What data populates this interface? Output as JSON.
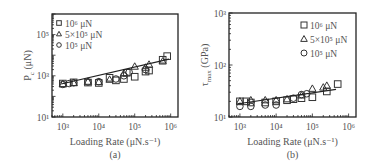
{
  "chart_data": [
    {
      "type": "scatter",
      "panel_label": "(a)",
      "title": "",
      "xlabel": "Loading Rate (μN.s⁻¹)",
      "ylabel": "P_c (μN)",
      "ylabel_main": "P",
      "ylabel_sub": "c",
      "ylabel_unit": " (μN)",
      "xscale": "log",
      "yscale": "log",
      "xlim": [
        500,
        1600000
      ],
      "ylim": [
        10,
        1000000
      ],
      "xticks": [
        1000,
        10000,
        100000,
        1000000
      ],
      "xtick_labels": [
        "10³",
        "10⁴",
        "10⁵",
        "10⁶"
      ],
      "yticks": [
        10,
        1000,
        100000
      ],
      "ytick_labels": [
        "10¹",
        "10³",
        "10⁵"
      ],
      "grid": false,
      "legend_position": "upper left",
      "legend": [
        "10⁶ μN",
        "5×10⁵ μN",
        "10⁵ μN"
      ],
      "series": [
        {
          "name": "10⁶ μN",
          "marker": "square",
          "x": [
            1000,
            2000,
            5000,
            10000,
            20000,
            30000,
            50000,
            60000,
            100000,
            200000,
            250000,
            600000,
            800000
          ],
          "y": [
            420,
            480,
            470,
            450,
            800,
            600,
            700,
            1400,
            900,
            1600,
            1800,
            6000,
            9000
          ]
        },
        {
          "name": "5×10⁵ μN",
          "marker": "triangle",
          "x": [
            1000,
            2000,
            5000,
            10000,
            20000,
            50000,
            100000,
            200000,
            250000,
            600000
          ],
          "y": [
            400,
            450,
            520,
            500,
            650,
            1300,
            2800,
            2500,
            3500,
            5000
          ]
        },
        {
          "name": "10⁵ μN",
          "marker": "circle",
          "x": [
            1000,
            1500,
            2000,
            5000,
            10000,
            30000,
            50000,
            70000,
            200000
          ],
          "y": [
            380,
            420,
            460,
            500,
            520,
            700,
            1000,
            1500,
            2000
          ]
        }
      ],
      "fit_line": {
        "x": [
          900,
          900000
        ],
        "y": [
          400,
          6500
        ]
      }
    },
    {
      "type": "scatter",
      "panel_label": "(b)",
      "title": "",
      "xlabel": "Loading Rate (μN.s⁻¹)",
      "ylabel": "τ_max (GPa)",
      "ylabel_main": "τ",
      "ylabel_sub": "max",
      "ylabel_unit": " (GPa)",
      "xscale": "log",
      "yscale": "log",
      "xlim": [
        500,
        1600000
      ],
      "ylim": [
        10,
        1000
      ],
      "xticks": [
        1000,
        10000,
        100000,
        1000000
      ],
      "xtick_labels": [
        "10³",
        "10⁴",
        "10⁵",
        "10⁶"
      ],
      "yticks": [
        10,
        100,
        1000
      ],
      "ytick_labels": [
        "10¹",
        "10²",
        "10³"
      ],
      "grid": false,
      "legend_position": "upper right",
      "legend": [
        "10⁶ μN",
        "5×10⁵ μN",
        "10⁵ μN"
      ],
      "series": [
        {
          "name": "10⁶ μN",
          "marker": "square",
          "x": [
            1000,
            1500,
            2000,
            5000,
            10000,
            20000,
            30000,
            50000,
            100000,
            250000,
            500000
          ],
          "y": [
            20,
            20,
            19,
            19,
            20,
            21,
            22,
            23,
            24,
            31,
            43
          ]
        },
        {
          "name": "5×10⁵ μN",
          "marker": "triangle",
          "x": [
            1000,
            2000,
            5000,
            10000,
            20000,
            50000,
            100000,
            200000,
            250000
          ],
          "y": [
            20,
            21,
            21,
            21,
            22,
            26,
            35,
            37,
            40
          ]
        },
        {
          "name": "10⁵ μN",
          "marker": "circle",
          "x": [
            1000,
            2000,
            5000,
            10000,
            30000,
            50000,
            70000
          ],
          "y": [
            16,
            16,
            17,
            17,
            23,
            27,
            28
          ]
        }
      ],
      "fit_line": {
        "x": [
          900,
          450000
        ],
        "y": [
          18,
          34
        ]
      }
    }
  ]
}
